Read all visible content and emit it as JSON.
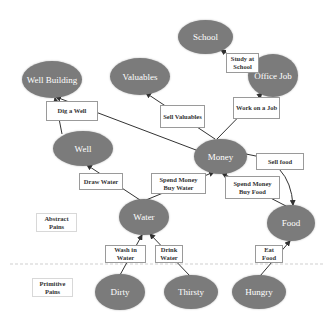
{
  "diagram": {
    "nodes": {
      "well_building": "Well Building",
      "valuables": "Valuables",
      "school": "School",
      "office_job": "Office Job",
      "money": "Money",
      "well": "Well",
      "water": "Water",
      "food": "Food",
      "dirty": "Dirty",
      "thirsty": "Thirsty",
      "hungry": "Hungry"
    },
    "actions": {
      "dig_a_well": "Dig a Well",
      "sell_valuables": "Sell Valuables",
      "study_at_school": "Study at School",
      "work_on_a_job": "Work on a Job",
      "sell_food": "Sell food",
      "draw_water": "Draw Water",
      "spend_money_buy_water": "Spend Money Buy Water",
      "spend_money_buy_food": "Spend Money Buy Food",
      "wash_in_water": "Wash in Water",
      "drink_water": "Drink Water",
      "eat_food": "Eat Food"
    },
    "levels": {
      "abstract": "Abstract Pains",
      "primitive": "Primitive Pains"
    },
    "colors": {
      "node_fill": "#7b7b7b",
      "node_text": "#ffffff",
      "edge": "#333333"
    }
  }
}
